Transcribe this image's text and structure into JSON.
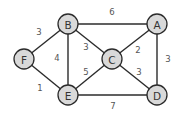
{
  "graph": {
    "title": "",
    "nodes": [
      {
        "id": "A",
        "label": "A",
        "x": 157,
        "y": 24
      },
      {
        "id": "B",
        "label": "B",
        "x": 68,
        "y": 24
      },
      {
        "id": "C",
        "label": "C",
        "x": 112,
        "y": 59
      },
      {
        "id": "D",
        "label": "D",
        "x": 157,
        "y": 95
      },
      {
        "id": "E",
        "label": "E",
        "x": 68,
        "y": 95
      },
      {
        "id": "F",
        "label": "F",
        "x": 24,
        "y": 59
      }
    ],
    "edges": [
      {
        "from": "B",
        "to": "A",
        "weight": "6",
        "lx": 112,
        "ly": 12
      },
      {
        "from": "F",
        "to": "B",
        "weight": "3",
        "lx": 39,
        "ly": 32
      },
      {
        "from": "B",
        "to": "E",
        "weight": "4",
        "lx": 57,
        "ly": 58
      },
      {
        "from": "B",
        "to": "C",
        "weight": "3",
        "lx": 86,
        "ly": 47
      },
      {
        "from": "C",
        "to": "A",
        "weight": "2",
        "lx": 138,
        "ly": 50
      },
      {
        "from": "A",
        "to": "D",
        "weight": "3",
        "lx": 168,
        "ly": 59
      },
      {
        "from": "E",
        "to": "C",
        "weight": "5",
        "lx": 86,
        "ly": 72
      },
      {
        "from": "C",
        "to": "D",
        "weight": "3",
        "lx": 139,
        "ly": 72
      },
      {
        "from": "F",
        "to": "E",
        "weight": "1",
        "lx": 40,
        "ly": 88
      },
      {
        "from": "E",
        "to": "D",
        "weight": "7",
        "lx": 113,
        "ly": 106
      }
    ],
    "node_radius": 10,
    "colors": {
      "node_fill": "#d9d9d9",
      "stroke": "#2b2b2b",
      "weight_text": "#555555",
      "node_text": "#333333"
    }
  }
}
